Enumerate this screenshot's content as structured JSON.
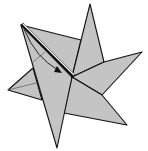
{
  "diagram": {
    "type": "origami-step",
    "colors": {
      "paper": "#c4c4c4",
      "edge": "#111111",
      "background": "#ffffff",
      "crease": "#555555"
    },
    "points": [
      "top",
      "upper-left",
      "right",
      "left",
      "bottom",
      "lower-right"
    ],
    "annotation": "fold-arrow"
  }
}
